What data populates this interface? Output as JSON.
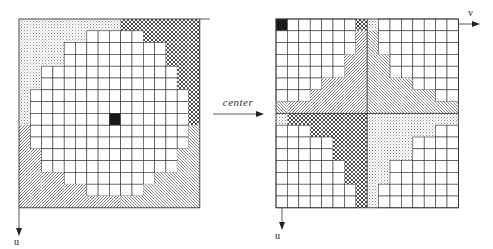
{
  "figure": {
    "left_panel": {
      "name": "original-frequency-grid",
      "rows": 16,
      "cols": 16,
      "origin_cell": [
        8,
        8
      ],
      "quadrant_split": {
        "row": 9,
        "col": 9
      },
      "quadrant_fills": {
        "top_left": "dotted",
        "top_right": "crosshatch",
        "bottom_left": "hatch-left",
        "bottom_right": "hatch-right"
      },
      "axis_u_label": "u",
      "axis_v_label": "v"
    },
    "right_panel": {
      "name": "centered-frequency-grid",
      "rows": 16,
      "cols": 16,
      "origin_cell": [
        0,
        0
      ],
      "axis_u_label": "u",
      "axis_v_label": "v"
    },
    "transform_label": "center",
    "shaded_cols_by_row_centered": [
      [
        7,
        8
      ],
      [
        7,
        8
      ],
      [
        7,
        8
      ],
      [
        6,
        9
      ],
      [
        6,
        9
      ],
      [
        4,
        11
      ],
      [
        3,
        13
      ],
      [
        0,
        15
      ],
      [
        0,
        15
      ],
      [
        3,
        13
      ],
      [
        5,
        11
      ],
      [
        5,
        11
      ],
      [
        6,
        9
      ],
      [
        6,
        9
      ],
      [
        7,
        8
      ],
      [
        7,
        8
      ]
    ],
    "colors": {
      "line": "#333333",
      "black_cell": "#1a1a1a",
      "background": "#ffffff"
    }
  }
}
